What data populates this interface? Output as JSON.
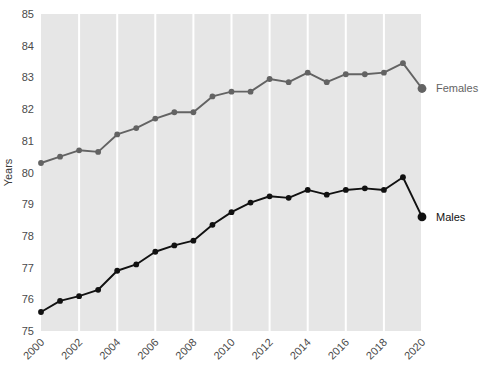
{
  "chart_data": {
    "type": "line",
    "title": "",
    "xlabel": "",
    "ylabel": "Years",
    "ylim": [
      75,
      85
    ],
    "xlim": [
      2000,
      2020
    ],
    "ytick_labels": [
      "75",
      "76",
      "77",
      "78",
      "79",
      "80",
      "81",
      "82",
      "83",
      "84",
      "85"
    ],
    "ytick_values": [
      75,
      76,
      77,
      78,
      79,
      80,
      81,
      82,
      83,
      84,
      85
    ],
    "xtick_labels": [
      "2000",
      "2002",
      "2004",
      "2006",
      "2008",
      "2010",
      "2012",
      "2014",
      "2016",
      "2018",
      "2020"
    ],
    "xtick_values": [
      2000,
      2002,
      2004,
      2006,
      2008,
      2010,
      2012,
      2014,
      2016,
      2018,
      2020
    ],
    "x": [
      2000,
      2001,
      2002,
      2003,
      2004,
      2005,
      2006,
      2007,
      2008,
      2009,
      2010,
      2011,
      2012,
      2013,
      2014,
      2015,
      2016,
      2017,
      2018,
      2019,
      2020
    ],
    "grid": "vertical-only",
    "legend_position": "right-inline",
    "plot_background": "#e6e6e6",
    "series": [
      {
        "name": "Females",
        "label": "Females",
        "color": "#636363",
        "marker": "circle",
        "values": [
          80.3,
          80.5,
          80.7,
          80.65,
          81.2,
          81.4,
          81.7,
          81.9,
          81.9,
          82.4,
          82.55,
          82.55,
          82.95,
          82.85,
          83.15,
          82.85,
          83.1,
          83.1,
          83.15,
          83.45,
          82.65
        ]
      },
      {
        "name": "Males",
        "label": "Males",
        "color": "#111111",
        "marker": "circle",
        "values": [
          75.6,
          75.95,
          76.1,
          76.3,
          76.9,
          77.1,
          77.5,
          77.7,
          77.85,
          78.35,
          78.75,
          79.05,
          79.25,
          79.2,
          79.45,
          79.3,
          79.45,
          79.5,
          79.45,
          79.85,
          78.6
        ]
      }
    ]
  },
  "axis": {
    "y_title": "Years"
  },
  "legend": {
    "females_label": "Females",
    "males_label": "Males"
  },
  "colors": {
    "females": "#636363",
    "males": "#111111",
    "plot_bg": "#e6e6e6",
    "gridline": "#ffffff",
    "tick_text": "#4a4a4a"
  }
}
